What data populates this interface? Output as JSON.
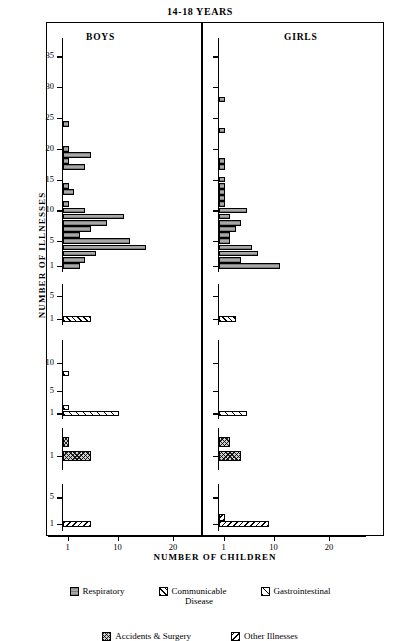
{
  "title": "14-18  YEARS",
  "panels": {
    "boys": "BOYS",
    "girls": "GIRLS"
  },
  "axes": {
    "ylabel": "NUMBER OF ILLNESSES",
    "xlabel": "NUMBER OF CHILDREN",
    "xticks": [
      1,
      10,
      20
    ]
  },
  "legend": {
    "row1": [
      {
        "key": "respiratory",
        "label": "Respiratory",
        "pattern": "p-resp"
      },
      {
        "key": "communicable",
        "label": "Communicable",
        "label2": "Disease",
        "pattern": "p-comm"
      },
      {
        "key": "gastrointestinal",
        "label": "Gastrointestinal",
        "pattern": "p-gast"
      }
    ],
    "row2": [
      {
        "key": "accidents",
        "label": "Accidents & Surgery",
        "pattern": "p-acc"
      },
      {
        "key": "other",
        "label": "Other Illnesses",
        "pattern": "p-other"
      }
    ]
  },
  "chart_data": {
    "type": "bar",
    "title": "14-18  YEARS",
    "xlabel": "NUMBER OF CHILDREN",
    "ylabel": "NUMBER OF ILLNESSES",
    "orientation": "horizontal",
    "xlim": [
      0,
      26
    ],
    "xticks": [
      1,
      10,
      20
    ],
    "grid": false,
    "legend_position": "bottom",
    "note": "Five stacked sub-panels per sex. y = number of illnesses, x = number of children.",
    "subplots": [
      {
        "category": "Respiratory",
        "pattern": "p-resp",
        "yticks": [
          1,
          5,
          10,
          15,
          20,
          25,
          30,
          35
        ],
        "ymax": 38,
        "series": [
          {
            "name": "BOYS",
            "points": [
              {
                "y": 24,
                "x": 1
              },
              {
                "y": 20,
                "x": 1
              },
              {
                "y": 19,
                "x": 5
              },
              {
                "y": 18,
                "x": 1
              },
              {
                "y": 17,
                "x": 4
              },
              {
                "y": 14,
                "x": 1
              },
              {
                "y": 13,
                "x": 2
              },
              {
                "y": 11,
                "x": 1
              },
              {
                "y": 10,
                "x": 4
              },
              {
                "y": 9,
                "x": 11
              },
              {
                "y": 8,
                "x": 8
              },
              {
                "y": 7,
                "x": 5
              },
              {
                "y": 6,
                "x": 3
              },
              {
                "y": 5,
                "x": 12
              },
              {
                "y": 4,
                "x": 15
              },
              {
                "y": 3,
                "x": 6
              },
              {
                "y": 2,
                "x": 4
              },
              {
                "y": 1,
                "x": 3
              }
            ]
          },
          {
            "name": "GIRLS",
            "points": [
              {
                "y": 28,
                "x": 1
              },
              {
                "y": 23,
                "x": 1
              },
              {
                "y": 18,
                "x": 1
              },
              {
                "y": 17,
                "x": 1
              },
              {
                "y": 15,
                "x": 1
              },
              {
                "y": 14,
                "x": 1
              },
              {
                "y": 13,
                "x": 1
              },
              {
                "y": 12,
                "x": 1
              },
              {
                "y": 11,
                "x": 1
              },
              {
                "y": 10,
                "x": 5
              },
              {
                "y": 9,
                "x": 2
              },
              {
                "y": 8,
                "x": 4
              },
              {
                "y": 7,
                "x": 3
              },
              {
                "y": 6,
                "x": 2
              },
              {
                "y": 5,
                "x": 2
              },
              {
                "y": 4,
                "x": 6
              },
              {
                "y": 3,
                "x": 7
              },
              {
                "y": 2,
                "x": 4
              },
              {
                "y": 1,
                "x": 11
              }
            ]
          }
        ]
      },
      {
        "category": "Communicable Disease",
        "pattern": "p-comm",
        "yticks": [
          1,
          5
        ],
        "ymax": 7,
        "series": [
          {
            "name": "BOYS",
            "points": [
              {
                "y": 1,
                "x": 5
              }
            ]
          },
          {
            "name": "GIRLS",
            "points": [
              {
                "y": 1,
                "x": 3
              }
            ]
          }
        ]
      },
      {
        "category": "Gastrointestinal",
        "pattern": "p-gast",
        "yticks": [
          1,
          5,
          10
        ],
        "ymax": 14,
        "series": [
          {
            "name": "BOYS",
            "points": [
              {
                "y": 8,
                "x": 1
              },
              {
                "y": 2,
                "x": 1
              },
              {
                "y": 1,
                "x": 10
              }
            ]
          },
          {
            "name": "GIRLS",
            "points": [
              {
                "y": 1,
                "x": 5
              }
            ]
          }
        ]
      },
      {
        "category": "Accidents & Surgery",
        "pattern": "p-acc",
        "yticks": [
          1
        ],
        "ymax": 3,
        "series": [
          {
            "name": "BOYS",
            "points": [
              {
                "y": 2,
                "x": 1
              },
              {
                "y": 1,
                "x": 5
              }
            ]
          },
          {
            "name": "GIRLS",
            "points": [
              {
                "y": 2,
                "x": 2
              },
              {
                "y": 1,
                "x": 4
              }
            ]
          }
        ]
      },
      {
        "category": "Other Illnesses",
        "pattern": "p-other",
        "yticks": [
          1,
          5
        ],
        "ymax": 7,
        "series": [
          {
            "name": "BOYS",
            "points": [
              {
                "y": 1,
                "x": 5
              }
            ]
          },
          {
            "name": "GIRLS",
            "points": [
              {
                "y": 2,
                "x": 1
              },
              {
                "y": 1,
                "x": 9
              }
            ]
          }
        ]
      }
    ]
  }
}
